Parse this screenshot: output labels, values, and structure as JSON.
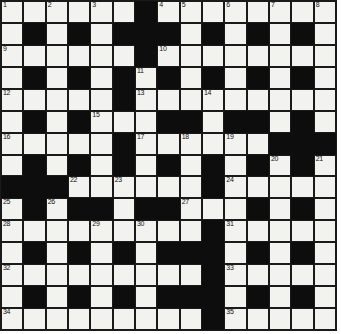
{
  "puzzle": {
    "title": "Crossword Grid",
    "type": "crossword",
    "rows": 15,
    "cols": 15,
    "colors": {
      "white_cell": "#f2f2ef",
      "black_cell": "#0d0d0d",
      "grid_line": "#1a1a1a",
      "number_text": "#111111",
      "page_background": "#ffffff"
    },
    "grid": [
      "WWWWWWBWWWWWWWW",
      "WBWBWBBBWBWBWBW",
      "WWWWWWBWWWWWWWW",
      "WBWBWBWBWBWBWBW",
      "WWWWWBWWWWWWWWW",
      "WBWBWWWBBWBBWBW",
      "WWWWWBWWWWWWBBB",
      "WBWBWBWBWBWBWBW",
      "BBBWWWWWWBWWWWW",
      "WBWBBWBBWWWBWBW",
      "WWWWWWWWWBWWWWW",
      "WBWBWBWBBBWBWBW",
      "WWWWWWWWWBWWWWW",
      "WBWBWBWBBBWBWBW",
      "WWWWWWWWWBWWWWW"
    ],
    "numbers": [
      {
        "row": 1,
        "col": 1,
        "label": "1"
      },
      {
        "row": 1,
        "col": 3,
        "label": "2"
      },
      {
        "row": 1,
        "col": 5,
        "label": "3"
      },
      {
        "row": 1,
        "col": 8,
        "label": "4"
      },
      {
        "row": 1,
        "col": 9,
        "label": "5"
      },
      {
        "row": 1,
        "col": 11,
        "label": "6"
      },
      {
        "row": 1,
        "col": 13,
        "label": "7"
      },
      {
        "row": 1,
        "col": 15,
        "label": "8"
      },
      {
        "row": 3,
        "col": 1,
        "label": "9"
      },
      {
        "row": 3,
        "col": 8,
        "label": "10"
      },
      {
        "row": 4,
        "col": 7,
        "label": "11"
      },
      {
        "row": 5,
        "col": 1,
        "label": "12"
      },
      {
        "row": 5,
        "col": 7,
        "label": "13"
      },
      {
        "row": 5,
        "col": 10,
        "label": "14"
      },
      {
        "row": 6,
        "col": 5,
        "label": "15"
      },
      {
        "row": 7,
        "col": 1,
        "label": "16"
      },
      {
        "row": 7,
        "col": 7,
        "label": "17"
      },
      {
        "row": 7,
        "col": 9,
        "label": "18"
      },
      {
        "row": 7,
        "col": 11,
        "label": "19"
      },
      {
        "row": 8,
        "col": 13,
        "label": "20"
      },
      {
        "row": 8,
        "col": 15,
        "label": "21"
      },
      {
        "row": 9,
        "col": 4,
        "label": "22"
      },
      {
        "row": 9,
        "col": 6,
        "label": "23"
      },
      {
        "row": 9,
        "col": 11,
        "label": "24"
      },
      {
        "row": 10,
        "col": 1,
        "label": "25"
      },
      {
        "row": 10,
        "col": 3,
        "label": "26"
      },
      {
        "row": 10,
        "col": 9,
        "label": "27"
      },
      {
        "row": 11,
        "col": 1,
        "label": "28"
      },
      {
        "row": 11,
        "col": 5,
        "label": "29"
      },
      {
        "row": 11,
        "col": 7,
        "label": "30"
      },
      {
        "row": 11,
        "col": 11,
        "label": "31"
      },
      {
        "row": 13,
        "col": 1,
        "label": "32"
      },
      {
        "row": 13,
        "col": 11,
        "label": "33"
      },
      {
        "row": 15,
        "col": 1,
        "label": "34"
      },
      {
        "row": 15,
        "col": 11,
        "label": "35"
      }
    ],
    "letters": []
  }
}
